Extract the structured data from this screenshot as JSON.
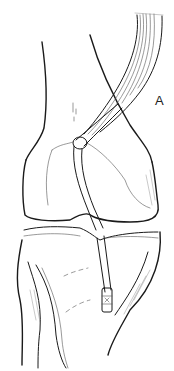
{
  "figure": {
    "panel_label": "A",
    "colors": {
      "background": "#ffffff",
      "line": "#1a1a1a"
    }
  }
}
